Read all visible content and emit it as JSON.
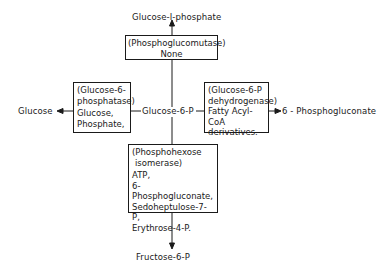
{
  "diagram": {
    "center": "Glucose-6-P",
    "top_product": "Glucose-I-phosphate",
    "left_product": "Glucose",
    "right_product": "6 - Phosphogluconate",
    "bottom_product": "Fructose-6-P",
    "boxes": {
      "top": {
        "enzyme": "(Phosphoglucomutase)",
        "inhibitors": "None"
      },
      "left": {
        "enzyme_l1": "(Glucose-6-",
        "enzyme_l2": "phosphatase)",
        "inh_l1": "Glucose,",
        "inh_l2": "Phosphate,"
      },
      "right": {
        "enzyme_l1": "(Glucose-6-P",
        "enzyme_l2": "dehydrogenase)",
        "inh_l1": "Fatty Acyl-CoA",
        "inh_l2": "derivatives."
      },
      "bottom": {
        "enzyme_l1": "(Phosphohexose",
        "enzyme_l2": "isomerase)",
        "inh_l1": "ATP,",
        "inh_l2": "6-Phosphogluconate,",
        "inh_l3": "Sedoheptulose-7-P,",
        "inh_l4": "Erythrose-4-P."
      }
    }
  }
}
